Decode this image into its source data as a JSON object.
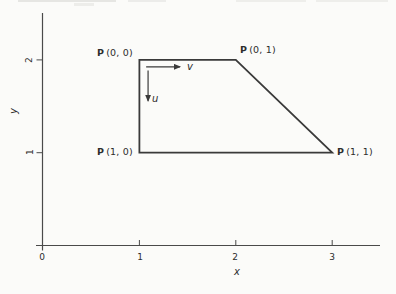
{
  "figure": {
    "colors": {
      "background": "#fbfbf9",
      "line": "#3a3a3a",
      "axis": "#4a4a4a",
      "text": "#2d2d2d"
    },
    "x_axis": {
      "label": "x",
      "ticks": [
        0,
        1,
        2,
        3
      ],
      "tick_labels": [
        "0",
        "1",
        "2",
        "3"
      ],
      "range": [
        0,
        3.5
      ]
    },
    "y_axis": {
      "label": "y",
      "ticks": [
        1,
        2
      ],
      "tick_labels": [
        "1",
        "2"
      ],
      "range": [
        0,
        2.5
      ]
    },
    "patch": {
      "vertices_xy": [
        [
          1,
          2
        ],
        [
          2,
          2
        ],
        [
          3,
          1
        ],
        [
          1,
          1
        ]
      ],
      "corner_labels": [
        {
          "p": "P",
          "coords": "(0, 0)",
          "at_xy": [
            1,
            2
          ]
        },
        {
          "p": "P",
          "coords": "(0, 1)",
          "at_xy": [
            2,
            2
          ]
        },
        {
          "p": "P",
          "coords": "(1, 0)",
          "at_xy": [
            1,
            1
          ]
        },
        {
          "p": "P",
          "coords": "(1, 1)",
          "at_xy": [
            3,
            1
          ]
        }
      ]
    },
    "vectors": [
      {
        "label": "v",
        "from_xy": [
          1.07,
          1.925
        ],
        "to_xy": [
          1.42,
          1.925
        ],
        "direction": "right"
      },
      {
        "label": "u",
        "from_xy": [
          1.09,
          1.885
        ],
        "to_xy": [
          1.09,
          1.56
        ],
        "direction": "down"
      }
    ]
  }
}
